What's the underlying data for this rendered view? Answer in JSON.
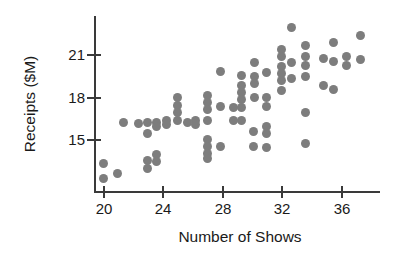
{
  "chart_data": {
    "type": "scatter",
    "title": "",
    "xlabel": "Number of Shows",
    "ylabel": "Receipts ($M)",
    "xlim": [
      19.2,
      38.6
    ],
    "ylim": [
      11.4,
      23.4
    ],
    "grid": false,
    "legend": null,
    "xticks": [
      20,
      24,
      28,
      32,
      36
    ],
    "yticks": [
      15,
      18,
      21
    ],
    "xtick_labels": [
      "20",
      "24",
      "28",
      "32",
      "36"
    ],
    "ytick_labels": [
      "15",
      "18",
      "21"
    ],
    "marker_color": "#7d7d7d",
    "axis_color": "#3a3a3a",
    "points": [
      [
        20,
        13.3
      ],
      [
        20,
        12.2
      ],
      [
        21,
        12.6
      ],
      [
        21.4,
        16.2
      ],
      [
        22.4,
        16.1
      ],
      [
        23,
        16.2
      ],
      [
        23,
        15.4
      ],
      [
        23,
        13.5
      ],
      [
        23,
        12.9
      ],
      [
        23.6,
        16.2
      ],
      [
        23.6,
        15.9
      ],
      [
        23.6,
        13.9
      ],
      [
        23.6,
        13.4
      ],
      [
        24.3,
        16.3
      ],
      [
        24.3,
        16.0
      ],
      [
        25,
        17.9
      ],
      [
        25,
        17.4
      ],
      [
        25,
        16.9
      ],
      [
        25,
        16.3
      ],
      [
        25.7,
        16.2
      ],
      [
        26.2,
        16.3
      ],
      [
        26.2,
        16.0
      ],
      [
        27,
        18.1
      ],
      [
        27,
        17.6
      ],
      [
        27,
        17.1
      ],
      [
        27,
        16.3
      ],
      [
        27,
        15.0
      ],
      [
        27,
        14.5
      ],
      [
        27,
        14.0
      ],
      [
        27,
        13.6
      ],
      [
        27.9,
        19.8
      ],
      [
        27.9,
        17.3
      ],
      [
        27.9,
        14.5
      ],
      [
        28.8,
        17.2
      ],
      [
        28.8,
        16.3
      ],
      [
        29.3,
        19.5
      ],
      [
        29.3,
        18.8
      ],
      [
        29.3,
        18.3
      ],
      [
        29.3,
        17.8
      ],
      [
        29.3,
        17.2
      ],
      [
        29.3,
        16.3
      ],
      [
        30.1,
        15.5
      ],
      [
        30.1,
        14.5
      ],
      [
        30.2,
        20.4
      ],
      [
        30.2,
        19.4
      ],
      [
        30.2,
        18.9
      ],
      [
        30.2,
        17.9
      ],
      [
        31,
        19.7
      ],
      [
        31,
        17.9
      ],
      [
        31,
        17.3
      ],
      [
        31,
        15.9
      ],
      [
        31,
        15.4
      ],
      [
        31,
        14.4
      ],
      [
        32,
        21.3
      ],
      [
        32,
        20.8
      ],
      [
        32,
        20.1
      ],
      [
        32,
        19.6
      ],
      [
        32,
        19.1
      ],
      [
        32,
        18.4
      ],
      [
        32.7,
        22.9
      ],
      [
        32.7,
        20.4
      ],
      [
        32.7,
        19.3
      ],
      [
        33.6,
        21.6
      ],
      [
        33.6,
        20.8
      ],
      [
        33.6,
        20.2
      ],
      [
        33.6,
        19.4
      ],
      [
        33.6,
        16.9
      ],
      [
        33.6,
        14.7
      ],
      [
        34.8,
        20.7
      ],
      [
        34.8,
        18.8
      ],
      [
        35.5,
        21.8
      ],
      [
        35.5,
        20.5
      ],
      [
        35.5,
        18.5
      ],
      [
        36.4,
        20.8
      ],
      [
        36.4,
        20.2
      ],
      [
        37.3,
        22.3
      ],
      [
        37.3,
        20.6
      ]
    ]
  }
}
